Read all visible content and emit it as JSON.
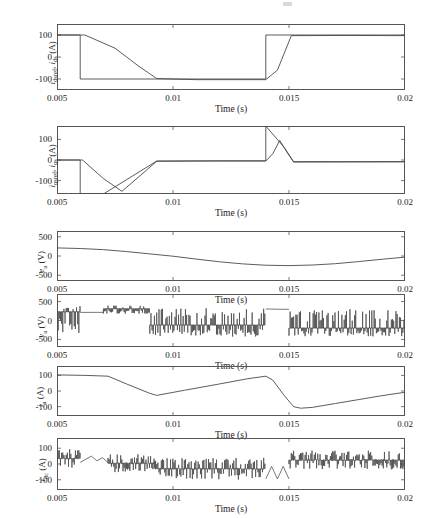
{
  "figure": {
    "width": 432,
    "height": 518,
    "background": "#ffffff",
    "trace_color": "#4a4a4a",
    "axis_color": "#555555"
  },
  "chart_data": [
    {
      "id": "plot-ids",
      "type": "line",
      "title": "",
      "ylabel": "i_dsref, i_ds (A)",
      "ylabel_parts": {
        "sym1": "i",
        "sub1": "dsref",
        "sym2": "i",
        "sub2": "ds",
        "unit": "(A)"
      },
      "xlabel": "Time (s)",
      "xlim": [
        0.005,
        0.02
      ],
      "ylim": [
        -150,
        150
      ],
      "xticks": [
        0.005,
        0.01,
        0.015,
        0.02
      ],
      "xticklabels": [
        "0.005",
        "0.01",
        "0.015",
        "0.02"
      ],
      "yticks": [
        -100,
        0,
        100
      ],
      "yticklabels": [
        "-100",
        "0",
        "100"
      ],
      "grid": false,
      "series": [
        {
          "name": "i_dsref",
          "kind": "reference-step",
          "points": [
            [
              0.005,
              100
            ],
            [
              0.006,
              100
            ],
            [
              0.006,
              -100
            ],
            [
              0.014,
              -100
            ],
            [
              0.014,
              100
            ],
            [
              0.02,
              100
            ]
          ]
        },
        {
          "name": "i_ds",
          "kind": "measured-ramp",
          "points": [
            [
              0.005,
              100
            ],
            [
              0.0062,
              100
            ],
            [
              0.0075,
              40
            ],
            [
              0.0085,
              -40
            ],
            [
              0.0093,
              -98
            ],
            [
              0.011,
              -103
            ],
            [
              0.014,
              -103
            ],
            [
              0.0145,
              -60
            ],
            [
              0.0151,
              97
            ],
            [
              0.0175,
              98
            ],
            [
              0.02,
              97
            ]
          ]
        }
      ]
    },
    {
      "id": "plot-iqs",
      "type": "line",
      "title": "",
      "ylabel": "i_qsref, i_qs (A)",
      "ylabel_parts": {
        "sym1": "i",
        "sub1": "qsref",
        "sym2": "i",
        "sub2": "qs",
        "unit": "(A)"
      },
      "xlabel": "Time (s)",
      "xlim": [
        0.005,
        0.02
      ],
      "ylim": [
        -165,
        165
      ],
      "xticks": [
        0.005,
        0.01,
        0.015,
        0.02
      ],
      "xticklabels": [
        "0.005",
        "0.01",
        "0.015",
        "0.02"
      ],
      "yticks": [
        -100,
        0,
        100
      ],
      "yticklabels": [
        "-100",
        "0",
        "100"
      ],
      "grid": false,
      "series": [
        {
          "name": "i_qsref",
          "kind": "reference-step",
          "points": [
            [
              0.005,
              0
            ],
            [
              0.006,
              0
            ],
            [
              0.006,
              -165
            ],
            [
              0.007,
              -165
            ],
            [
              0.0093,
              -5
            ],
            [
              0.0115,
              -4
            ],
            [
              0.014,
              -4
            ],
            [
              0.014,
              165
            ],
            [
              0.0148,
              60
            ],
            [
              0.0152,
              -8
            ],
            [
              0.02,
              -8
            ]
          ]
        },
        {
          "name": "i_qs",
          "kind": "measured-ramp",
          "points": [
            [
              0.005,
              0
            ],
            [
              0.0061,
              0
            ],
            [
              0.007,
              -90
            ],
            [
              0.0078,
              -152
            ],
            [
              0.0093,
              -6
            ],
            [
              0.012,
              -5
            ],
            [
              0.014,
              -5
            ],
            [
              0.0143,
              30
            ],
            [
              0.0146,
              95
            ],
            [
              0.0149,
              40
            ],
            [
              0.0152,
              -10
            ],
            [
              0.02,
              -9
            ]
          ]
        }
      ]
    },
    {
      "id": "plot-ea",
      "type": "line",
      "title": "",
      "ylabel": "e_a (V)",
      "ylabel_parts": {
        "sym1": "e",
        "sub1": "a",
        "unit": "(V)"
      },
      "xlabel": "Time (s)",
      "xlim": [
        0.005,
        0.02
      ],
      "ylim": [
        -650,
        650
      ],
      "xticks": [
        0.005,
        0.01,
        0.015,
        0.02
      ],
      "xticklabels": [
        "0.005",
        "0.01",
        "0.015",
        "0.02"
      ],
      "yticks": [
        -500,
        0,
        500
      ],
      "yticklabels": [
        "-500",
        "0",
        "500"
      ],
      "grid": false,
      "series": [
        {
          "name": "e_a",
          "kind": "sinusoid",
          "description": "slow back-EMF sinusoid, peak ~+210 V at 0.005 s, minimum ~-250 V near 0.0145-0.015 s, rising to ~-30 V at 0.02 s",
          "points": [
            [
              0.005,
              210
            ],
            [
              0.006,
              195
            ],
            [
              0.007,
              165
            ],
            [
              0.008,
              115
            ],
            [
              0.009,
              55
            ],
            [
              0.01,
              -5
            ],
            [
              0.011,
              -80
            ],
            [
              0.012,
              -150
            ],
            [
              0.013,
              -205
            ],
            [
              0.014,
              -240
            ],
            [
              0.015,
              -250
            ],
            [
              0.016,
              -235
            ],
            [
              0.017,
              -200
            ],
            [
              0.018,
              -145
            ],
            [
              0.019,
              -85
            ],
            [
              0.02,
              -30
            ]
          ]
        }
      ]
    },
    {
      "id": "plot-va",
      "type": "line",
      "title": "",
      "ylabel": "v_a (V)",
      "ylabel_parts": {
        "sym1": "v",
        "sub1": "a",
        "unit": "(V)"
      },
      "xlabel": "Time (s)",
      "xlim": [
        0.005,
        0.02
      ],
      "ylim": [
        -700,
        700
      ],
      "xticks": [
        0.005,
        0.01,
        0.015,
        0.02
      ],
      "xticklabels": [
        "0.005",
        "0.01",
        "0.015",
        "0.02"
      ],
      "yticks": [
        -500,
        0,
        500
      ],
      "yticklabels": [
        "-500",
        "0",
        "500"
      ],
      "grid": false,
      "series": [
        {
          "name": "v_a",
          "kind": "pwm-switching",
          "description": "PWM inverter phase voltage; dense switching bursts between roughly +400 and -400 V with quiet plateau segments",
          "segments": [
            {
              "t0": 0.005,
              "t1": 0.006,
              "baseline": 230,
              "hi": 400,
              "lo": -330,
              "dense": true
            },
            {
              "t0": 0.006,
              "t1": 0.007,
              "baseline": 215,
              "hi": 215,
              "lo": 215,
              "dense": false
            },
            {
              "t0": 0.007,
              "t1": 0.009,
              "baseline": 310,
              "hi": 400,
              "lo": 180,
              "dense": true
            },
            {
              "t0": 0.009,
              "t1": 0.014,
              "baseline": -120,
              "hi": 330,
              "lo": -430,
              "dense": true
            },
            {
              "t0": 0.014,
              "t1": 0.015,
              "baseline": 300,
              "hi": 330,
              "lo": 150,
              "dense": false
            },
            {
              "t0": 0.015,
              "t1": 0.02,
              "baseline": -200,
              "hi": 300,
              "lo": -420,
              "dense": true
            }
          ]
        }
      ]
    },
    {
      "id": "plot-ia",
      "type": "line",
      "title": "",
      "ylabel": "i_a (A)",
      "ylabel_parts": {
        "sym1": "i",
        "sub1": "a",
        "unit": "(A)"
      },
      "xlabel": "Time (s)",
      "xlim": [
        0.005,
        0.02
      ],
      "ylim": [
        -160,
        160
      ],
      "xticks": [
        0.005,
        0.01,
        0.015,
        0.02
      ],
      "xticklabels": [
        "0.005",
        "0.01",
        "0.015",
        "0.02"
      ],
      "yticks": [
        -100,
        0,
        100
      ],
      "yticklabels": [
        "-100",
        "0",
        "100"
      ],
      "grid": false,
      "series": [
        {
          "name": "i_a",
          "kind": "line",
          "points": [
            [
              0.005,
              103
            ],
            [
              0.0062,
              100
            ],
            [
              0.0072,
              95
            ],
            [
              0.008,
              45
            ],
            [
              0.009,
              -15
            ],
            [
              0.0093,
              -28
            ],
            [
              0.0105,
              5
            ],
            [
              0.012,
              45
            ],
            [
              0.0132,
              78
            ],
            [
              0.014,
              95
            ],
            [
              0.0143,
              70
            ],
            [
              0.0148,
              -30
            ],
            [
              0.0152,
              -100
            ],
            [
              0.0155,
              -110
            ],
            [
              0.016,
              -105
            ],
            [
              0.017,
              -80
            ],
            [
              0.018,
              -55
            ],
            [
              0.019,
              -30
            ],
            [
              0.02,
              -8
            ]
          ]
        }
      ]
    },
    {
      "id": "plot-idc",
      "type": "line",
      "title": "",
      "ylabel": "i_dc (A)",
      "ylabel_parts": {
        "sym1": "i",
        "sub1": "dc",
        "unit": "(A)"
      },
      "xlabel": "Time (s)",
      "xlim": [
        0.005,
        0.02
      ],
      "ylim": [
        -165,
        165
      ],
      "xticks": [
        0.005,
        0.01,
        0.015,
        0.02
      ],
      "xticklabels": [
        "0.005",
        "0.01",
        "0.015",
        "0.02"
      ],
      "yticks": [
        -100,
        0,
        100
      ],
      "yticklabels": [
        "-100",
        "0",
        "100"
      ],
      "grid": false,
      "series": [
        {
          "name": "i_dc",
          "kind": "pwm-chopped",
          "description": "DC-link current: chopped pulse train; envelope decays from ~+95 A at 0.005 s to ~-100 A near 0.0095 s, noisy band through 0.014 s, sawtooth recovery at 0.0145-0.015 s, then dense band ~+80/-30 A to 0.02 s",
          "segments": [
            {
              "t0": 0.005,
              "t1": 0.006,
              "hi": 95,
              "lo": -25,
              "dense": true
            },
            {
              "t0": 0.006,
              "t1": 0.0072,
              "hi": 60,
              "lo": 10,
              "dense": false
            },
            {
              "t0": 0.0072,
              "t1": 0.0092,
              "hi": 62,
              "lo": -55,
              "dense": true
            },
            {
              "t0": 0.0092,
              "t1": 0.014,
              "hi": 40,
              "lo": -100,
              "dense": true
            },
            {
              "t0": 0.014,
              "t1": 0.015,
              "hi": 65,
              "lo": -95,
              "dense": false
            },
            {
              "t0": 0.015,
              "t1": 0.02,
              "hi": 85,
              "lo": -35,
              "dense": true
            }
          ]
        }
      ]
    }
  ],
  "labels": {
    "time_axis": "Time (s)"
  }
}
